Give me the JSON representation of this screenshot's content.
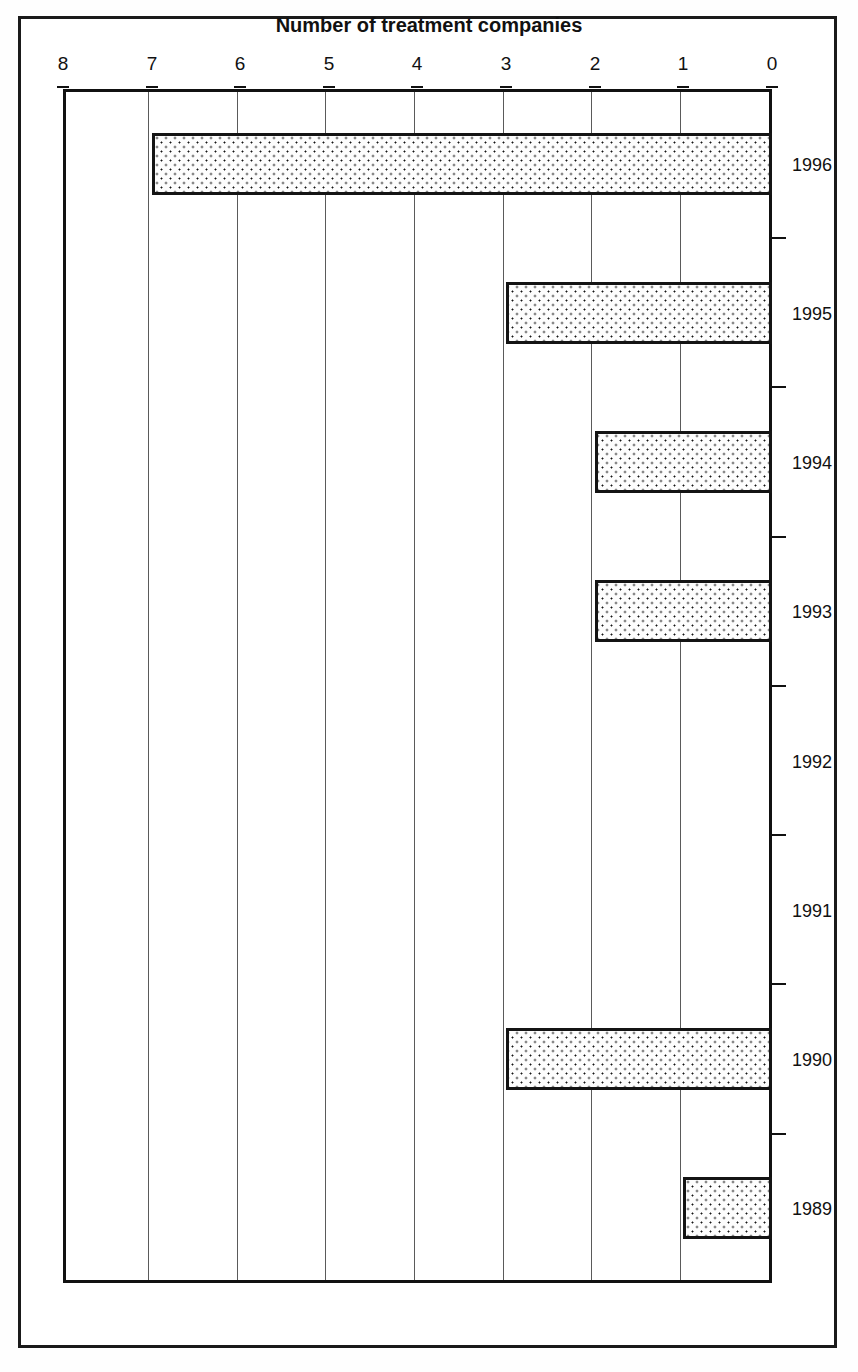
{
  "figure": {
    "orientation": "rotated-180",
    "frame_color": "#1a1a1a",
    "bar_fill_color": "#fdfdfd",
    "bar_border_color": "#141414",
    "gridline_color": "#5a5a5a"
  },
  "chart_data": {
    "type": "bar",
    "orientation": "horizontal",
    "title": "",
    "xlabel": "Number of treatment companies",
    "ylabel": "",
    "categories": [
      "1989",
      "1990",
      "1991",
      "1992",
      "1993",
      "1994",
      "1995",
      "1996"
    ],
    "values": [
      1,
      3,
      0,
      0,
      2,
      2,
      3,
      7
    ],
    "value_axis_ticks": [
      "0",
      "1",
      "2",
      "3",
      "4",
      "5",
      "6",
      "7",
      "8"
    ],
    "xlim": [
      0,
      8
    ],
    "grid": true,
    "legend": null,
    "annotations": []
  }
}
